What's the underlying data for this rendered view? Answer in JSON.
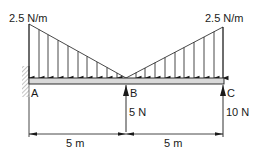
{
  "diagram": {
    "loads": {
      "left_intensity": "2.5 N/m",
      "right_intensity": "2.5 N/m"
    },
    "points": {
      "a": "A",
      "b": "B",
      "c": "C"
    },
    "reactions": {
      "b": "5 N",
      "c": "10 N"
    },
    "dimensions": {
      "ab": "5 m",
      "bc": "5 m"
    },
    "colors": {
      "line": "#1a1a1a",
      "beam_fill": "#d9d9d9",
      "hatch": "#888888"
    }
  }
}
